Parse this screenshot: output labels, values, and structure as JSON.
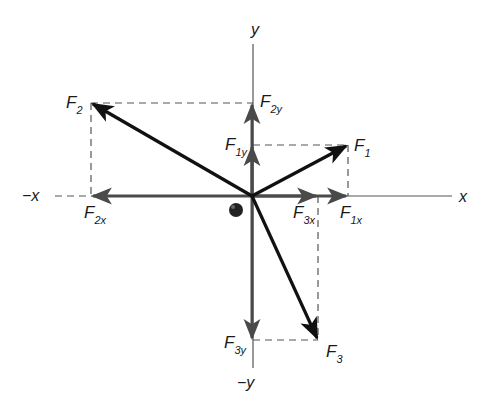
{
  "diagram": {
    "type": "vector-components",
    "colors": {
      "background": "#ffffff",
      "resultant": "#111111",
      "component": "#4a4a4a",
      "axis": "#555555",
      "dashed": "#555555",
      "dot": "#222222"
    },
    "origin": {
      "x": 252,
      "y": 196
    },
    "axes": {
      "x_pos_label": "x",
      "x_neg_label": "−x",
      "y_pos_label": "y",
      "y_neg_label": "−y"
    },
    "forces": [
      {
        "name": "F1",
        "label_main": "F",
        "label_sub": "1",
        "tip": {
          "x": 348,
          "y": 145
        },
        "x_component": {
          "label_main": "F",
          "label_sub": "1x",
          "end_x": 348
        },
        "y_component": {
          "label_main": "F",
          "label_sub": "1y",
          "end_y": 145
        }
      },
      {
        "name": "F2",
        "label_main": "F",
        "label_sub": "2",
        "tip": {
          "x": 91,
          "y": 103
        },
        "x_component": {
          "label_main": "F",
          "label_sub": "2x",
          "end_x": 91
        },
        "y_component": {
          "label_main": "F",
          "label_sub": "2y",
          "end_y": 103
        }
      },
      {
        "name": "F3",
        "label_main": "F",
        "label_sub": "3",
        "tip": {
          "x": 318,
          "y": 340
        },
        "x_component": {
          "label_main": "F",
          "label_sub": "3x",
          "end_x": 318
        },
        "y_component": {
          "label_main": "F",
          "label_sub": "3y",
          "end_y": 340
        }
      }
    ],
    "object_dot": {
      "x": 236,
      "y": 210
    }
  }
}
